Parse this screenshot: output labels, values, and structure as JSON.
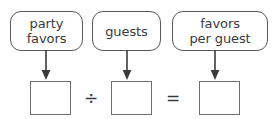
{
  "diagram": {
    "labels": [
      {
        "id": "party-favors",
        "text": "party\nfavors"
      },
      {
        "id": "guests",
        "text": "guests"
      },
      {
        "id": "favors-per-guest",
        "text": "favors\nper guest"
      }
    ],
    "arrows": [
      {
        "id": "arrow-to-dividend",
        "direction": "down"
      },
      {
        "id": "arrow-to-divisor",
        "direction": "down"
      },
      {
        "id": "arrow-to-quotient",
        "direction": "down"
      }
    ],
    "inputs": [
      {
        "id": "dividend",
        "value": "",
        "placeholder": ""
      },
      {
        "id": "divisor",
        "value": "",
        "placeholder": ""
      },
      {
        "id": "quotient",
        "value": "",
        "placeholder": ""
      }
    ],
    "operators": [
      {
        "id": "divide",
        "symbol": "÷"
      },
      {
        "id": "equals",
        "symbol": "="
      }
    ],
    "colors": {
      "label_border": "#58585a",
      "input_border": "#6e6e70",
      "text": "#3a3a3c",
      "arrow": "#3a3a3c",
      "background": "#ffffff"
    }
  }
}
